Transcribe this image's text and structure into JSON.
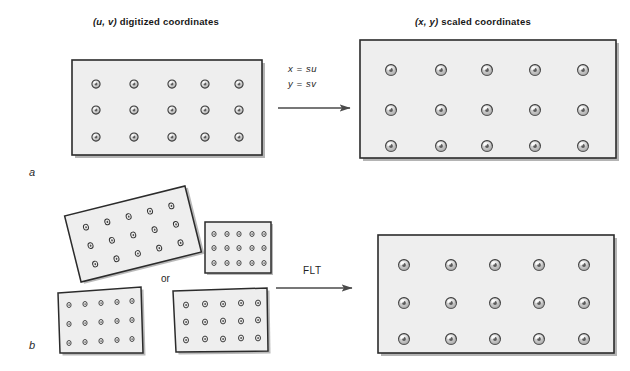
{
  "figure": {
    "type": "diagram",
    "background_color": "#ffffff",
    "plate_fill": "#eeeeee",
    "plate_stroke": "#2b2b2b",
    "shadow_color": "#9a9a9a",
    "target_ring_color": "#3a3a3a",
    "target_fill": "#e8e8e8"
  },
  "panels": [
    {
      "key": "a",
      "label": "a",
      "label_x": 33,
      "label_y": 174,
      "source_caption": "digitized coordinates",
      "source_caption_prefix": "(u, v)",
      "target_caption": "scaled coordinates",
      "target_caption_prefix": "(x, y)",
      "equations": [
        "x  =  su",
        "y  =  sv"
      ],
      "grid": {
        "cols": 5,
        "rows": 3
      }
    },
    {
      "key": "b",
      "label": "b",
      "label_x": 33,
      "label_y": 348,
      "transform_label": "FLT",
      "alternative_label": "or",
      "grid": {
        "cols": 5,
        "rows": 3
      },
      "distorted_shapes": [
        {
          "name": "rotated-plate",
          "description": "rotated rectangle"
        },
        {
          "name": "small-plate",
          "description": "small upright rectangle"
        },
        {
          "name": "skewed-plate",
          "description": "skewed quadrilateral"
        },
        {
          "name": "perspective-plate",
          "description": "perspective trapezoid"
        }
      ]
    }
  ],
  "captions": {
    "top_left_prefix": "(u, v)",
    "top_left_text": " digitized coordinates",
    "top_right_prefix": "(x, y)",
    "top_right_text": " scaled coordinates"
  },
  "equations": {
    "eq1": "x  =  su",
    "eq2": "y  =  sv"
  },
  "labels": {
    "panel_a": "a",
    "panel_b": "b",
    "or": "or",
    "flt": "FLT"
  }
}
